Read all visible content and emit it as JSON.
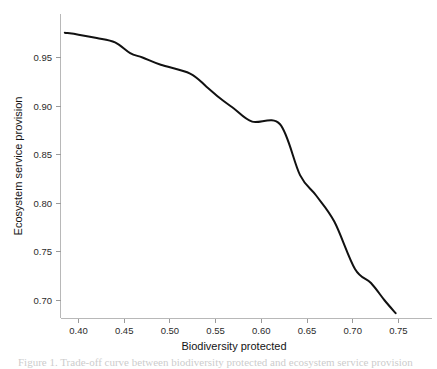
{
  "figure": {
    "background_color": "#ffffff",
    "caption_partial": "Figure 1. Trade-off curve between biodiversity protected and ecosystem service provision"
  },
  "chart_data": {
    "type": "line",
    "title": "",
    "xlabel": "Biodiversity protected",
    "ylabel": "Ecosystem service provision",
    "xlim": [
      0.385,
      0.762
    ],
    "ylim": [
      0.686,
      0.982
    ],
    "xticks": [
      "0.40",
      "0.45",
      "0.50",
      "0.55",
      "0.60",
      "0.65",
      "0.70",
      "0.75"
    ],
    "xtick_values": [
      0.4,
      0.45,
      0.5,
      0.55,
      0.6,
      0.65,
      0.7,
      0.75
    ],
    "yticks": [
      "0.95",
      "0.90",
      "0.85",
      "0.80",
      "0.75",
      "0.70"
    ],
    "ytick_values": [
      0.95,
      0.9,
      0.85,
      0.8,
      0.75,
      0.7
    ],
    "grid": false,
    "legend": false,
    "legend_position": "none",
    "line_color": "#111111",
    "axis_color": "#b8b8b8",
    "series": [
      {
        "name": "Trade-off frontier",
        "x": [
          0.385,
          0.4,
          0.42,
          0.44,
          0.4565,
          0.47,
          0.49,
          0.5221,
          0.54,
          0.5549,
          0.57,
          0.59,
          0.6205,
          0.6424,
          0.66,
          0.68,
          0.7025,
          0.72,
          0.735,
          0.747
        ],
        "y": [
          0.9755,
          0.9735,
          0.97,
          0.9655,
          0.9545,
          0.95,
          0.9425,
          0.9335,
          0.92,
          0.908,
          0.8975,
          0.884,
          0.8813,
          0.829,
          0.808,
          0.781,
          0.7325,
          0.718,
          0.7,
          0.687
        ]
      }
    ]
  },
  "axes": {
    "x_axis_name": "x-axis",
    "y_axis_name": "y-axis"
  }
}
